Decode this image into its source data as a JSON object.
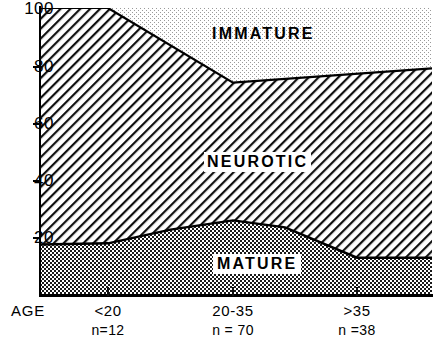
{
  "chart_data": {
    "type": "area",
    "stacked": true,
    "title": "",
    "xlabel": "AGE",
    "ylabel": "",
    "ylim": [
      0,
      100
    ],
    "yticks": [
      20,
      40,
      60,
      80,
      100
    ],
    "grid": false,
    "legend": "inline-band-labels",
    "categories": [
      "<20",
      "20-35",
      ">35"
    ],
    "category_sublabels": [
      "n=12",
      "n = 70",
      "n =38"
    ],
    "sample_sizes": [
      12,
      70,
      38
    ],
    "series": [
      {
        "name": "MATURE",
        "values": [
          18,
          26,
          13
        ],
        "pattern": "dark-checkerboard",
        "color": "#808080"
      },
      {
        "name": "NEUROTIC",
        "values": [
          82,
          48,
          66
        ],
        "pattern": "diagonal-hatch",
        "color": "#ffffff"
      },
      {
        "name": "IMMATURE",
        "values": [
          0,
          26,
          21
        ],
        "pattern": "fine-stipple",
        "color": "#fbfbfb"
      }
    ],
    "cumulative_boundaries": {
      "mature_top": [
        18,
        26,
        13
      ],
      "neurotic_top": [
        100,
        74,
        79
      ]
    }
  },
  "axes": {
    "y_tick_labels": [
      "100",
      "80",
      "60",
      "40",
      "20"
    ],
    "x_axis_title": "AGE"
  },
  "bands": {
    "immature": {
      "label": "IMMATURE"
    },
    "neurotic": {
      "label": "NEUROTIC"
    },
    "mature": {
      "label": "MATURE"
    }
  },
  "colors": {
    "axis": "#000000",
    "mature_fill": "#7f7f7f",
    "neurotic_fill": "#ffffff",
    "immature_fill": "#fcfcfc",
    "line": "#000000",
    "background": "#ffffff"
  }
}
